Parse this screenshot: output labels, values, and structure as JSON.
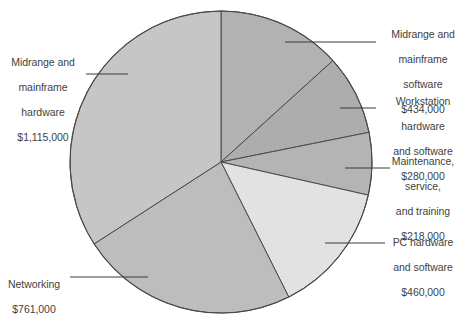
{
  "chart_data": {
    "type": "pie",
    "title": "",
    "currency": "$",
    "total": 3268000,
    "start_angle_deg": 0,
    "direction": "clockwise",
    "categories": [
      "Midrange and mainframe software",
      "Workstation hardware and software",
      "Maintenance, service, and training",
      "PC hardware and software",
      "Networking",
      "Midrange and mainframe hardware"
    ],
    "values": [
      434000,
      280000,
      218000,
      460000,
      761000,
      1115000
    ],
    "value_labels": [
      "$434,000",
      "$280,000",
      "$218,000",
      "$460,000",
      "$761,000",
      "$1,115,000"
    ],
    "slices": [
      {
        "id": "midrange-mainframe-software",
        "name": "Midrange and mainframe software",
        "label_lines": [
          "Midrange and",
          "mainframe",
          "software"
        ],
        "value": 434000,
        "value_label": "$434,000",
        "percent": 13.3,
        "angle_deg": 47.8,
        "color": "#b2b2b2",
        "label_side": "right"
      },
      {
        "id": "workstation-hardware-software",
        "name": "Workstation hardware and software",
        "label_lines": [
          "Workstation",
          "hardware",
          "and software"
        ],
        "value": 280000,
        "value_label": "$280,000",
        "percent": 8.6,
        "angle_deg": 30.8,
        "color": "#adadad",
        "label_side": "right"
      },
      {
        "id": "maintenance-service-training",
        "name": "Maintenance, service, and training",
        "label_lines": [
          "Maintenance,",
          "service,",
          "and training"
        ],
        "value": 218000,
        "value_label": "$218,000",
        "percent": 6.7,
        "angle_deg": 24.0,
        "color": "#b4b4b4",
        "label_side": "right"
      },
      {
        "id": "pc-hardware-software",
        "name": "PC hardware and software",
        "label_lines": [
          "PC hardware",
          "and software"
        ],
        "value": 460000,
        "value_label": "$460,000",
        "percent": 14.1,
        "angle_deg": 50.7,
        "color": "#e2e2e2",
        "label_side": "right"
      },
      {
        "id": "networking",
        "name": "Networking",
        "label_lines": [
          "Networking"
        ],
        "value": 761000,
        "value_label": "$761,000",
        "percent": 23.3,
        "angle_deg": 83.8,
        "color": "#bdbdbd",
        "label_side": "left"
      },
      {
        "id": "midrange-mainframe-hardware",
        "name": "Midrange and mainframe hardware",
        "label_lines": [
          "Midrange and",
          "mainframe",
          "hardware"
        ],
        "value": 1115000,
        "value_label": "$1,115,000",
        "percent": 34.1,
        "angle_deg": 122.8,
        "color": "#c6c6c6",
        "label_side": "left"
      }
    ],
    "geometry": {
      "cx": 221,
      "cy": 162,
      "r": 151
    },
    "grid": false,
    "legend": "none",
    "xlabel": "",
    "ylabel": ""
  },
  "callouts": {
    "midrange_software": {
      "l1": "Midrange and",
      "l2": "mainframe",
      "l3": "software",
      "value": "$434,000"
    },
    "workstation": {
      "l1": "Workstation",
      "l2": "hardware",
      "l3": "and software",
      "value": "$280,000"
    },
    "maintenance": {
      "l1": "Maintenance,",
      "l2": "service,",
      "l3": "and training",
      "value": "$218,000"
    },
    "pc_hardware": {
      "l1": "PC hardware",
      "l2": "and software",
      "value": "$460,000"
    },
    "networking": {
      "l1": "Networking",
      "value": "$761,000"
    },
    "midrange_hardware": {
      "l1": "Midrange and",
      "l2": "mainframe",
      "l3": "hardware",
      "value": "$1,115,000"
    }
  }
}
